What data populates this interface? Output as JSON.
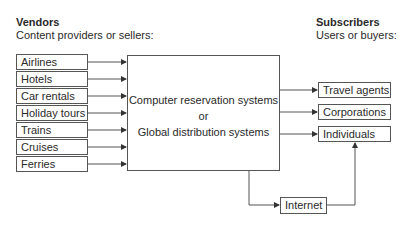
{
  "vendors": {
    "title": "Vendors",
    "subtitle": "Content providers or sellers:",
    "items": [
      "Airlines",
      "Hotels",
      "Car rentals",
      "Holiday tours",
      "Trains",
      "Cruises",
      "Ferries"
    ]
  },
  "subscribers": {
    "title": "Subscribers",
    "subtitle": "Users or buyers:",
    "items": [
      "Travel agents",
      "Corporations",
      "Individuals"
    ]
  },
  "center": {
    "line1": "Computer reservation systems",
    "line2": "or",
    "line3": "Global distribution systems"
  },
  "internet": "Internet"
}
